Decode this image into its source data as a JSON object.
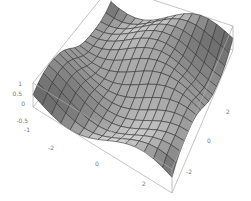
{
  "chart_data": {
    "type": "surface3d",
    "title": "",
    "function_hint": "z = sin(x + sin(y))-like wave surface",
    "x_range": [
      -3,
      3
    ],
    "y_range": [
      -3,
      3
    ],
    "z_range": [
      -1,
      1
    ],
    "mesh": {
      "nx": 15,
      "ny": 15
    },
    "axes": {
      "x": {
        "label": "",
        "ticks": [
          "-2",
          "0",
          "2"
        ]
      },
      "y": {
        "label": "",
        "ticks": [
          "-2",
          "0",
          "2"
        ]
      },
      "z": {
        "label": "",
        "ticks": [
          "1",
          "0.5",
          "0",
          "-0.5",
          "-1"
        ]
      }
    },
    "box": true,
    "legend": null,
    "colors": {
      "surface_light": "#d9d9d9",
      "surface_dark": "#5a5a5a",
      "mesh_line": "#333333",
      "box_line": "#aaaaaa",
      "tick_text": "#777777"
    }
  }
}
